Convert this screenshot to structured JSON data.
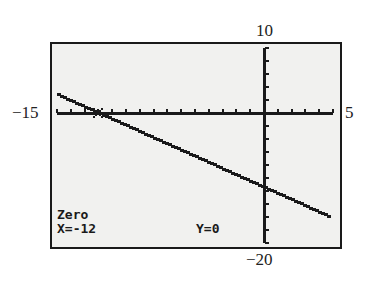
{
  "window_labels": {
    "ymax": "10",
    "ymin": "−20",
    "xmin": "−15",
    "xmax": "5"
  },
  "screen": {
    "mode_label": "Zero",
    "x_readout": "X=-12",
    "y_readout": "Y=0"
  },
  "colors": {
    "screen_bg": "#f1f1ef",
    "ink": "#1a1a1a"
  },
  "chart_data": {
    "type": "line",
    "title": "",
    "xlabel": "",
    "ylabel": "",
    "xlim": [
      -15,
      5
    ],
    "ylim": [
      -20,
      10
    ],
    "xscale": 1,
    "yscale": 2,
    "grid": false,
    "series": [
      {
        "name": "Y1",
        "x": [
          -15,
          -12,
          0,
          5
        ],
        "y": [
          2.85,
          0,
          -11.4,
          -16.2
        ]
      }
    ],
    "annotations": [
      {
        "text": "Zero",
        "position": "bottom-left"
      },
      {
        "text": "X=-12",
        "position": "bottom-left"
      },
      {
        "text": "Y=0",
        "position": "bottom-center"
      }
    ],
    "zero_point": {
      "x": -12,
      "y": 0
    }
  }
}
